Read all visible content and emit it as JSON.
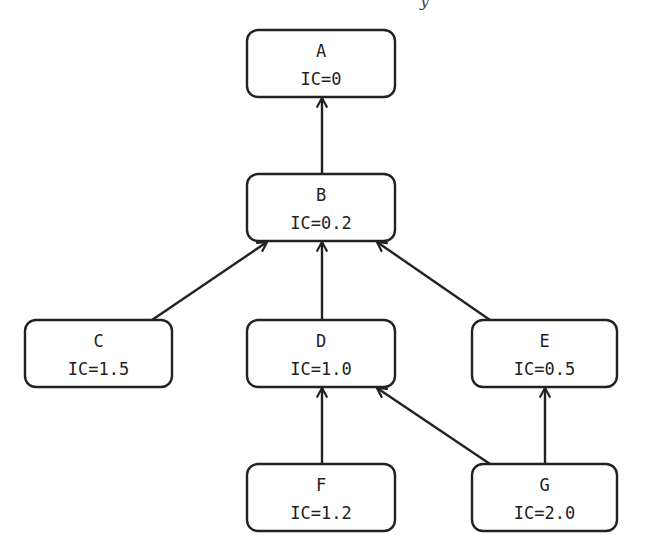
{
  "diagram": {
    "type": "directed-acyclic-graph",
    "stroke_color": "#222222",
    "background": "#ffffff",
    "top_fragment": "y",
    "nodes": [
      {
        "id": "A",
        "label": "A",
        "ic": "IC=0",
        "x": 247,
        "y": 30,
        "w": 148,
        "h": 67
      },
      {
        "id": "B",
        "label": "B",
        "ic": "IC=0.2",
        "x": 247,
        "y": 174,
        "w": 148,
        "h": 67
      },
      {
        "id": "C",
        "label": "C",
        "ic": "IC=1.5",
        "x": 25,
        "y": 320,
        "w": 147,
        "h": 67
      },
      {
        "id": "D",
        "label": "D",
        "ic": "IC=1.0",
        "x": 247,
        "y": 320,
        "w": 148,
        "h": 67
      },
      {
        "id": "E",
        "label": "E",
        "ic": "IC=0.5",
        "x": 472,
        "y": 320,
        "w": 145,
        "h": 67
      },
      {
        "id": "F",
        "label": "F",
        "ic": "IC=1.2",
        "x": 247,
        "y": 464,
        "w": 148,
        "h": 67
      },
      {
        "id": "G",
        "label": "G",
        "ic": "IC=2.0",
        "x": 472,
        "y": 464,
        "w": 145,
        "h": 67
      }
    ],
    "edges": [
      {
        "from": "B",
        "to": "A",
        "x1": 322,
        "y1": 174,
        "x2": 322,
        "y2": 98
      },
      {
        "from": "C",
        "to": "B",
        "x1": 152,
        "y1": 320,
        "x2": 267,
        "y2": 242
      },
      {
        "from": "D",
        "to": "B",
        "x1": 322,
        "y1": 320,
        "x2": 322,
        "y2": 242
      },
      {
        "from": "E",
        "to": "B",
        "x1": 490,
        "y1": 320,
        "x2": 377,
        "y2": 242
      },
      {
        "from": "F",
        "to": "D",
        "x1": 322,
        "y1": 464,
        "x2": 322,
        "y2": 388
      },
      {
        "from": "G",
        "to": "D",
        "x1": 490,
        "y1": 464,
        "x2": 377,
        "y2": 388
      },
      {
        "from": "G",
        "to": "E",
        "x1": 545,
        "y1": 464,
        "x2": 545,
        "y2": 388
      }
    ]
  }
}
